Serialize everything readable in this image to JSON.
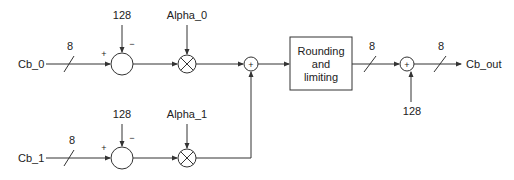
{
  "diagram": {
    "inputs": {
      "top": "Cb_0",
      "bottom": "Cb_1"
    },
    "output": "Cb_out",
    "bus_width_labels": {
      "input_top": "8",
      "input_bottom": "8",
      "after_rounding": "8",
      "output": "8"
    },
    "offsets": {
      "top_subtract": "128",
      "bottom_subtract": "128",
      "final_add": "128"
    },
    "weights": {
      "top": "Alpha_0",
      "bottom": "Alpha_1"
    },
    "signs": {
      "plus": "+",
      "minus": "−"
    },
    "block": {
      "line1": "Rounding",
      "line2": "and",
      "line3": "limiting"
    },
    "adder_symbol": "+"
  }
}
